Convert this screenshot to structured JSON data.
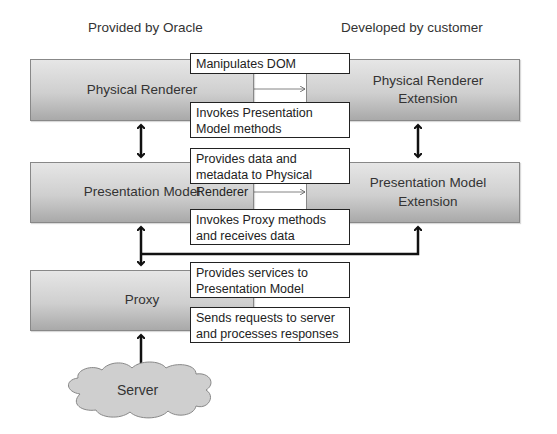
{
  "headers": {
    "left": "Provided by Oracle",
    "right": "Developed by customer"
  },
  "components": {
    "physical_renderer": "Physical Renderer",
    "physical_renderer_ext": "Physical Renderer Extension",
    "presentation_model": "Presentation Model",
    "presentation_model_ext": "Presentation Model Extension",
    "proxy": "Proxy",
    "server": "Server"
  },
  "labels": {
    "manipulates_dom": "Manipulates DOM",
    "invokes_pm_methods": "Invokes Presentation Model methods",
    "provides_data": "Provides data and metadata to Physical Renderer",
    "invokes_proxy": "Invokes Proxy methods and receives data",
    "provides_services": "Provides services to Presentation Model",
    "sends_requests": "Sends requests to server and processes responses"
  },
  "colors": {
    "box_top": "#e6e6e6",
    "box_bottom": "#a9a9a9",
    "line": "#111111"
  }
}
